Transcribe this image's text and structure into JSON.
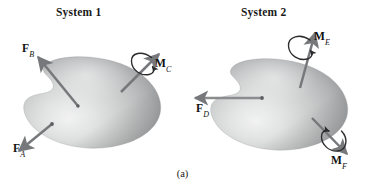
{
  "figure": {
    "caption": "(a)",
    "systems": [
      {
        "id": "system-1",
        "title": "System 1",
        "vectors": [
          {
            "id": "FB",
            "symbol": "F",
            "subscript": "B",
            "kind": "force",
            "direction": "up-left"
          },
          {
            "id": "FA",
            "symbol": "F",
            "subscript": "A",
            "kind": "force",
            "direction": "down-left"
          },
          {
            "id": "MC",
            "symbol": "M",
            "subscript": "C",
            "kind": "moment",
            "direction": "up-right"
          }
        ]
      },
      {
        "id": "system-2",
        "title": "System 2",
        "vectors": [
          {
            "id": "ME",
            "symbol": "M",
            "subscript": "E",
            "kind": "moment",
            "direction": "up"
          },
          {
            "id": "FD",
            "symbol": "F",
            "subscript": "D",
            "kind": "force",
            "direction": "left"
          },
          {
            "id": "MF",
            "symbol": "M",
            "subscript": "F",
            "kind": "moment",
            "direction": "down-right"
          }
        ]
      }
    ]
  },
  "colors": {
    "arrow": "#77797c",
    "arrow_dark": "#5f6164",
    "moment_arc": "#2b2b2b",
    "body_light": "#e9eaea",
    "body_mid": "#b5b7b8",
    "body_dark": "#7d7f80",
    "text": "#111111",
    "background": "#ffffff"
  }
}
